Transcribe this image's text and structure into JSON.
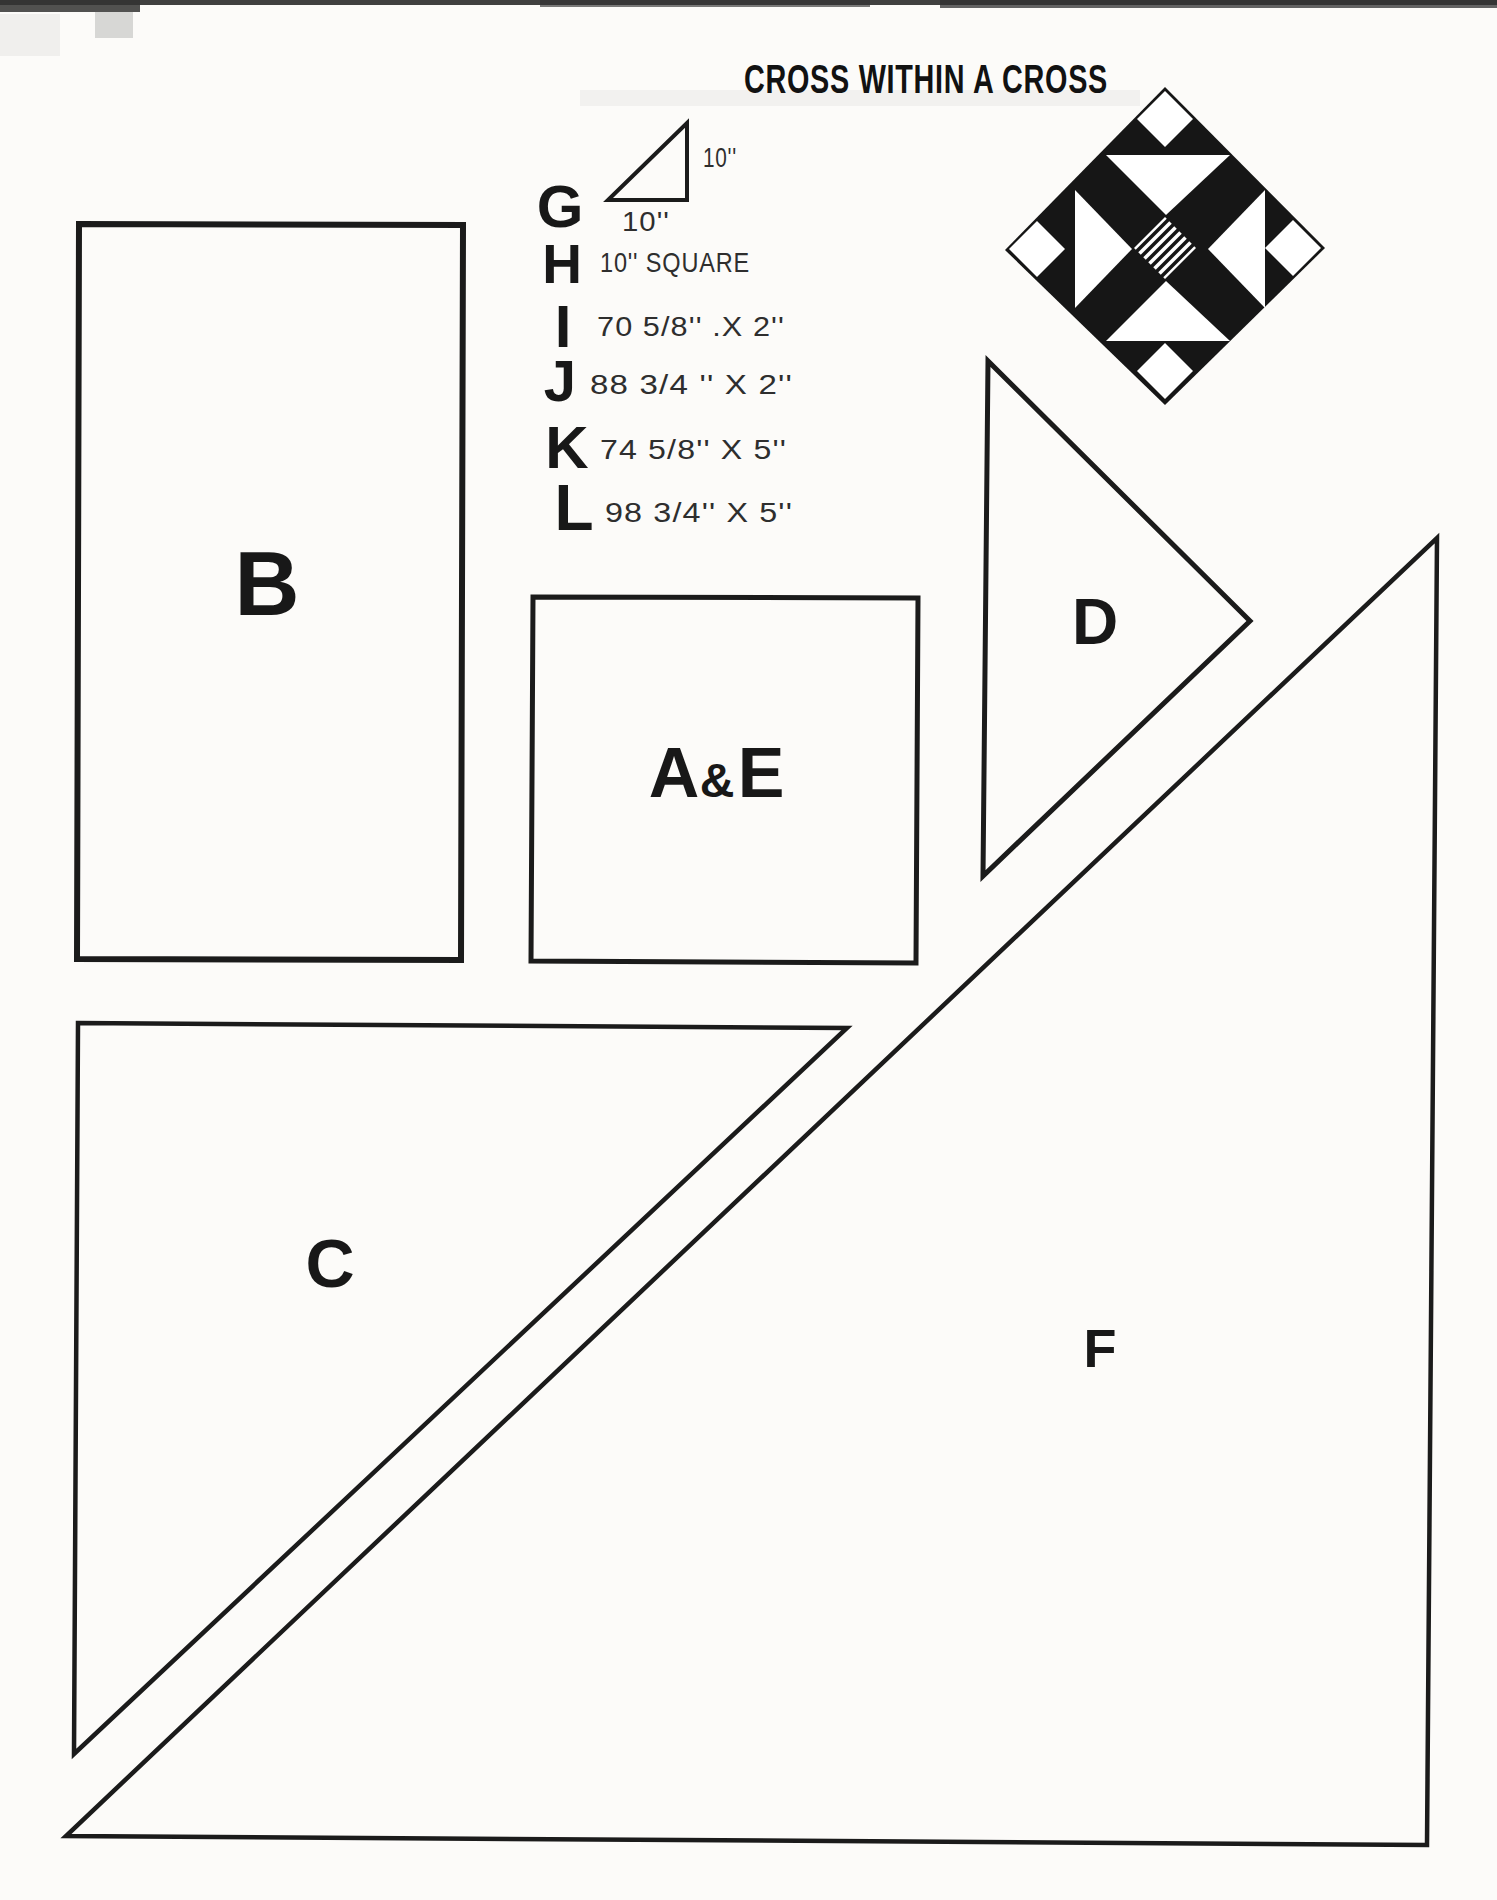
{
  "colors": {
    "paper": "#fcfbf9",
    "ink": "#1b1b1b"
  },
  "title": "CROSS WITHIN A CROSS",
  "legend": {
    "items": [
      {
        "letter": "G",
        "dim_vertical": "10''",
        "dim_horizontal": "10''"
      },
      {
        "letter": "H",
        "dim": "10'' SQUARE"
      },
      {
        "letter": "I",
        "dim": "70 5/8'' .X 2''"
      },
      {
        "letter": "J",
        "dim": "88 3/4 '' X 2''"
      },
      {
        "letter": "K",
        "dim": "74 5/8'' X 5''"
      },
      {
        "letter": "L",
        "dim": "98 3/4'' X 5''"
      }
    ]
  },
  "pieces": {
    "b": "B",
    "ae_first": "A",
    "ae_amp": "&",
    "ae_second": "E",
    "c": "C",
    "d": "D",
    "f": "F"
  }
}
